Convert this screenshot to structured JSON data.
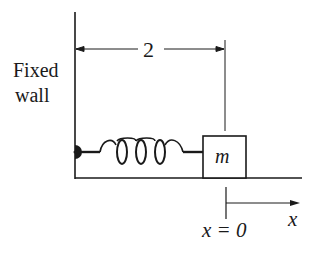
{
  "diagram": {
    "wall_label_line1": "Fixed",
    "wall_label_line2": "wall",
    "dimension_label": "2",
    "mass_label": "m",
    "axis_label": "x",
    "origin_label": "x = 0",
    "colors": {
      "ink": "#1a1a1a",
      "background": "#ffffff"
    }
  }
}
